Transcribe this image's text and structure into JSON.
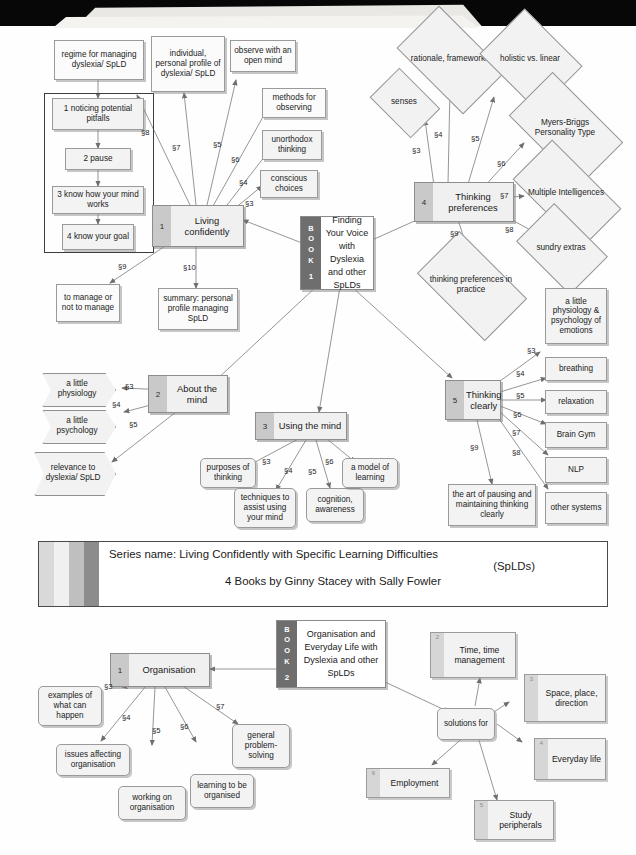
{
  "book1": {
    "cover": {
      "spine_word": "BOOK",
      "spine_number": "1",
      "title": "Finding Your Voice with Dyslexia and other SpLDs"
    },
    "chapters": [
      {
        "num": "1",
        "title": "Living confidently"
      },
      {
        "num": "2",
        "title": "About the mind"
      },
      {
        "num": "3",
        "title": "Using the mind"
      },
      {
        "num": "4",
        "title": "Thinking preferences"
      },
      {
        "num": "5",
        "title": "Thinking clearly"
      }
    ],
    "living_confidently": {
      "topics": [
        {
          "sec": "§3",
          "label": "conscious choices"
        },
        {
          "sec": "§4",
          "label": "unorthodox thinking"
        },
        {
          "sec": "§5",
          "label": "observe with an open mind"
        },
        {
          "sec": "§6",
          "label": "methods for observing"
        },
        {
          "sec": "§7",
          "label": "individual, personal profile of dyslexia/ SpLD"
        },
        {
          "sec": "§8",
          "label": "regime for managing dyslexia/ SpLD"
        },
        {
          "sec": "§9",
          "label": "to manage or not to manage"
        },
        {
          "sec": "§10",
          "label": "summary: personal profile managing SpLD"
        }
      ],
      "regime_steps": [
        "1 noticing potential pitfalls",
        "2 pause",
        "3 know how your mind works",
        "4 know your goal"
      ]
    },
    "about_the_mind": {
      "topics": [
        {
          "sec": "§3",
          "label": "a little physiology"
        },
        {
          "sec": "§4",
          "label": "a little psychology"
        },
        {
          "sec": "§5",
          "label": "relevance to dyslexia/ SpLD"
        }
      ]
    },
    "using_the_mind": {
      "topics": [
        {
          "sec": "§3",
          "label": "purposes of thinking"
        },
        {
          "sec": "§4",
          "label": "techniques to assist using your mind"
        },
        {
          "sec": "§5",
          "label": "cognition, awareness"
        },
        {
          "sec": "§6",
          "label": "a model of learning"
        }
      ]
    },
    "thinking_preferences": {
      "topics": [
        {
          "sec": "§3",
          "label": "senses"
        },
        {
          "sec": "§4",
          "label": "rationale, frameworks"
        },
        {
          "sec": "§5",
          "label": "holistic vs. linear"
        },
        {
          "sec": "§6",
          "label": "Myers-Briggs Personality Type"
        },
        {
          "sec": "§7",
          "label": "Multiple Intelligences"
        },
        {
          "sec": "§8",
          "label": "sundry extras"
        },
        {
          "sec": "§9",
          "label": "thinking preferences in practice"
        }
      ]
    },
    "thinking_clearly": {
      "topics": [
        {
          "sec": "§3",
          "label": "a little physiology & psychology of emotions"
        },
        {
          "sec": "§4",
          "label": "breathing"
        },
        {
          "sec": "§5",
          "label": "relaxation"
        },
        {
          "sec": "§6",
          "label": "Brain Gym"
        },
        {
          "sec": "§7",
          "label": "NLP"
        },
        {
          "sec": "§8",
          "label": "other systems"
        },
        {
          "sec": "§9",
          "label": "the art of pausing and maintaining thinking clearly"
        }
      ]
    }
  },
  "series_banner": {
    "line1": "Series name: Living Confidently with Specific Learning Difficulties",
    "line2": "(SpLDs)",
    "line3": "4 Books by Ginny Stacey with Sally Fowler",
    "swatch_colors": [
      "#d9d9d9",
      "#f0f0f0",
      "#bfbfbf",
      "#8c8c8c"
    ]
  },
  "book2": {
    "cover": {
      "spine_word": "BOOK",
      "spine_number": "2",
      "title": "Organisation and Everyday Life with Dyslexia and other SpLDs"
    },
    "chapter": {
      "num": "1",
      "title": "Organisation"
    },
    "organisation_topics": [
      {
        "sec": "§3",
        "label": "examples of what can happen"
      },
      {
        "sec": "§4",
        "label": "issues affecting organisation"
      },
      {
        "sec": "§5",
        "label": "working on organisation"
      },
      {
        "sec": "§6",
        "label": "learning to be organised"
      },
      {
        "sec": "§7",
        "label": "general problem-solving"
      }
    ],
    "solutions_hub": "solutions for",
    "solution_areas": [
      {
        "num": "2",
        "label": "Time, time management"
      },
      {
        "num": "3",
        "label": "Space, place, direction"
      },
      {
        "num": "4",
        "label": "Everyday life"
      },
      {
        "num": "5",
        "label": "Study peripherals"
      },
      {
        "num": "6",
        "label": "Employment"
      }
    ]
  }
}
